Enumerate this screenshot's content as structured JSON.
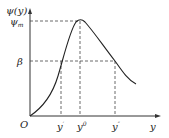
{
  "diagram": {
    "y_axis_label": "ψ(y)",
    "x_axis_label": "y",
    "origin_label": "O",
    "y_ticks": [
      {
        "label": "ψm",
        "base": "ψ",
        "sub": "m"
      },
      {
        "label": "β"
      }
    ],
    "x_ticks": [
      {
        "label": "y'",
        "base": "y",
        "sup": "′"
      },
      {
        "label": "y⁰",
        "base": "y",
        "sup": "0"
      },
      {
        "label": "y''",
        "base": "y",
        "sup": "″"
      }
    ],
    "curve": "rises from origin through (y', β) to peak (y⁰, ψm), then falls through (y'', β) and levels off"
  }
}
